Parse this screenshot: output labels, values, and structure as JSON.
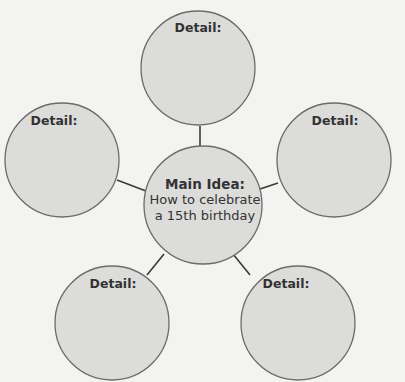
{
  "diagram": {
    "type": "idea-web",
    "main": {
      "title": "Main Idea:",
      "lines": [
        "How to celebrate",
        "a 15th birthday"
      ]
    },
    "details": [
      {
        "id": "top",
        "label": "Detail:"
      },
      {
        "id": "left",
        "label": "Detail:"
      },
      {
        "id": "right",
        "label": "Detail:"
      },
      {
        "id": "bottom-left",
        "label": "Detail:"
      },
      {
        "id": "bottom-right",
        "label": "Detail:"
      }
    ],
    "colors": {
      "background": "#f3f3f1",
      "bubble_fill": "#dcdcda",
      "bubble_stroke": "#6b6b6b",
      "connector": "#3a3a3a",
      "text": "#333333"
    }
  }
}
